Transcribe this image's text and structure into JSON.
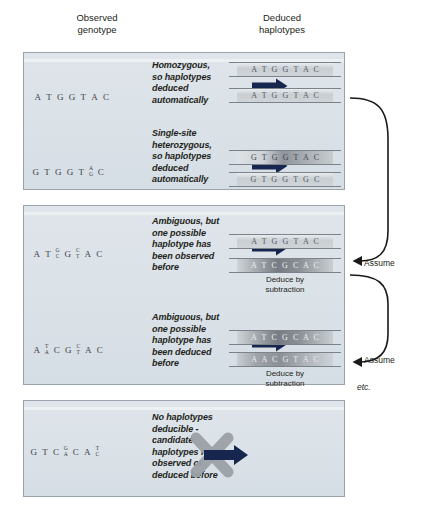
{
  "figure": {
    "headers": {
      "observed": "Observed\ngenotype",
      "deduced": "Deduced\nhaplotypes"
    },
    "side_labels": {
      "assume_1": "Assume",
      "assume_2": "Assume",
      "etc": "etc."
    },
    "deduce_note": "Deduce by\nsubtraction",
    "colors": {
      "panel_fill": "#dbe2e8",
      "panel_border": "#9aa3ab",
      "arrow": "#16264f",
      "x_mark": "#9aa0a6",
      "text": "#231f20"
    },
    "rows": [
      {
        "id": "row-homozygous",
        "genotype_label": "A T G G T A C",
        "genotype": [
          {
            "type": "single",
            "base": "A"
          },
          {
            "type": "single",
            "base": "T"
          },
          {
            "type": "single",
            "base": "G"
          },
          {
            "type": "single",
            "base": "G"
          },
          {
            "type": "single",
            "base": "T"
          },
          {
            "type": "single",
            "base": "A"
          },
          {
            "type": "single",
            "base": "C"
          }
        ],
        "caption": "Homozygous,\nso haplotypes\ndeduced\nautomatically",
        "arrow": "straight-arrow",
        "haplotypes": [
          {
            "seq": "A T G G T A C",
            "shade": "light"
          },
          {
            "seq": "A T G G T A C",
            "shade": "light"
          }
        ],
        "note": ""
      },
      {
        "id": "row-single-site-heterozygous",
        "genotype_label": "G T G G T A/G C",
        "genotype": [
          {
            "type": "single",
            "base": "G"
          },
          {
            "type": "single",
            "base": "T"
          },
          {
            "type": "single",
            "base": "G"
          },
          {
            "type": "single",
            "base": "G"
          },
          {
            "type": "single",
            "base": "T"
          },
          {
            "type": "ambiguous",
            "top": "A",
            "bottom": "G"
          },
          {
            "type": "single",
            "base": "C"
          }
        ],
        "caption": "Single-site\nheterozygous,\nso haplotypes\ndeduced\nautomatically",
        "arrow": "straight-arrow",
        "haplotypes": [
          {
            "seq": "G T G G T A C",
            "shade": "mid"
          },
          {
            "seq": "G T G G T G C",
            "shade": "light"
          }
        ],
        "note": ""
      },
      {
        "id": "row-ambiguous-observed",
        "genotype_label": "A T G/C G C/T A C",
        "genotype": [
          {
            "type": "single",
            "base": "A"
          },
          {
            "type": "single",
            "base": "T"
          },
          {
            "type": "ambiguous",
            "top": "G",
            "bottom": "C"
          },
          {
            "type": "single",
            "base": "G"
          },
          {
            "type": "ambiguous",
            "top": "C",
            "bottom": "T"
          },
          {
            "type": "single",
            "base": "A"
          },
          {
            "type": "single",
            "base": "C"
          }
        ],
        "caption": "Ambiguous, but\none possible\nhaplotype has\nbeen observed\nbefore",
        "arrow": "straight-arrow",
        "haplotypes": [
          {
            "seq": "A T G G T A C",
            "shade": "light"
          },
          {
            "seq": "A T C G C A C",
            "shade": "dark"
          }
        ],
        "note": "Deduce by\nsubtraction"
      },
      {
        "id": "row-ambiguous-deduced",
        "genotype_label": "A T/A C G C/T A C",
        "genotype": [
          {
            "type": "single",
            "base": "A"
          },
          {
            "type": "ambiguous",
            "top": "T",
            "bottom": "A"
          },
          {
            "type": "single",
            "base": "C"
          },
          {
            "type": "single",
            "base": "G"
          },
          {
            "type": "ambiguous",
            "top": "C",
            "bottom": "T"
          },
          {
            "type": "single",
            "base": "A"
          },
          {
            "type": "single",
            "base": "C"
          }
        ],
        "caption": "Ambiguous, but\none possible\nhaplotype has\nbeen deduced\nbefore",
        "arrow": "straight-arrow",
        "haplotypes": [
          {
            "seq": "A T C G C A C",
            "shade": "dark"
          },
          {
            "seq": "A A C G T A C",
            "shade": "dark2"
          }
        ],
        "note": "Deduce by\nsubtraction"
      },
      {
        "id": "row-no-haplotypes",
        "genotype_label": "G T C G/A C A T/C",
        "genotype": [
          {
            "type": "single",
            "base": "G"
          },
          {
            "type": "single",
            "base": "T"
          },
          {
            "type": "single",
            "base": "C"
          },
          {
            "type": "ambiguous",
            "top": "G",
            "bottom": "A"
          },
          {
            "type": "single",
            "base": "C"
          },
          {
            "type": "single",
            "base": "A"
          },
          {
            "type": "ambiguous",
            "top": "T",
            "bottom": "C"
          }
        ],
        "caption": "No haplotypes\ndeducible -\ncandidate\nhaplotypes not\nobserved or\ndeduced before",
        "arrow": "crossed-arrow",
        "haplotypes": [],
        "note": ""
      }
    ]
  }
}
